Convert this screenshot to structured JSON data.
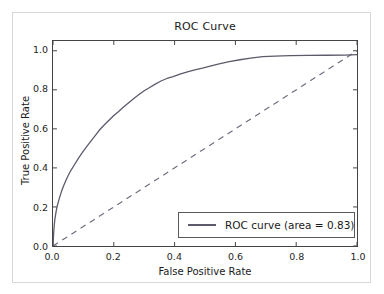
{
  "chart_data": {
    "type": "line",
    "title": "ROC Curve",
    "xlabel": "False Positive Rate",
    "ylabel": "True Positive Rate",
    "xlim": [
      0.0,
      1.0
    ],
    "ylim": [
      0.0,
      1.05
    ],
    "grid": false,
    "legend_position": "lower right",
    "xticks": [
      "0.0",
      "0.2",
      "0.4",
      "0.6",
      "0.8",
      "1.0"
    ],
    "xtick_values": [
      0.0,
      0.2,
      0.4,
      0.6,
      0.8,
      1.0
    ],
    "yticks": [
      "0.0",
      "0.2",
      "0.4",
      "0.6",
      "0.8",
      "1.0"
    ],
    "ytick_values": [
      0.0,
      0.2,
      0.4,
      0.6,
      0.8,
      1.0
    ],
    "auc": 0.83,
    "series": [
      {
        "name": "ROC curve (area = 0.83)",
        "style": "solid",
        "color": "#5b5b6b",
        "x": [
          0.0,
          0.002,
          0.004,
          0.006,
          0.01,
          0.014,
          0.02,
          0.028,
          0.036,
          0.046,
          0.058,
          0.07,
          0.084,
          0.098,
          0.112,
          0.126,
          0.14,
          0.155,
          0.17,
          0.185,
          0.2,
          0.215,
          0.232,
          0.25,
          0.268,
          0.285,
          0.3,
          0.318,
          0.335,
          0.355,
          0.375,
          0.395,
          0.42,
          0.445,
          0.47,
          0.495,
          0.52,
          0.55,
          0.58,
          0.615,
          0.65,
          0.69,
          0.73,
          0.78,
          0.84,
          0.9,
          0.96,
          1.0
        ],
        "y": [
          0.0,
          0.06,
          0.105,
          0.135,
          0.175,
          0.205,
          0.24,
          0.28,
          0.312,
          0.348,
          0.385,
          0.415,
          0.45,
          0.482,
          0.512,
          0.54,
          0.568,
          0.598,
          0.622,
          0.645,
          0.668,
          0.688,
          0.712,
          0.735,
          0.758,
          0.778,
          0.795,
          0.812,
          0.828,
          0.845,
          0.858,
          0.868,
          0.882,
          0.893,
          0.903,
          0.912,
          0.922,
          0.934,
          0.944,
          0.954,
          0.962,
          0.97,
          0.973,
          0.975,
          0.976,
          0.977,
          0.978,
          0.98
        ]
      },
      {
        "name": "chance-diagonal",
        "style": "dashed",
        "color": "#6e6e80",
        "x": [
          0.0,
          1.0
        ],
        "y": [
          0.0,
          1.0
        ]
      }
    ]
  },
  "legend": {
    "entries": [
      {
        "label": "ROC curve (area = 0.83)",
        "swatch_color": "#5b5b6b"
      }
    ]
  },
  "colors": {
    "curve": "#5b5b6b",
    "diagonal": "#6e6e80",
    "axis": "#444444",
    "text": "#1a1a1a",
    "background": "#ffffff",
    "outer_frame": "#d8d8d8"
  }
}
